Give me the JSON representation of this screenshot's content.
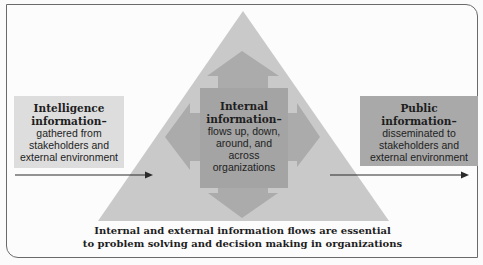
{
  "diagram": {
    "left_box": {
      "title_line1": "Intelligence",
      "title_line2": "information–",
      "body": [
        "gathered from",
        "stakeholders and",
        "external environment"
      ]
    },
    "center_box": {
      "title_line1": "Internal",
      "title_line2": "information–",
      "body": [
        "flows up, down,",
        "around, and",
        "across",
        "organizations"
      ]
    },
    "right_box": {
      "title_line1": "Public",
      "title_line2": "information–",
      "body": [
        "disseminated to",
        "stakeholders and",
        "external environment"
      ]
    },
    "caption": {
      "line1": "Internal and external information flows are essential",
      "line2": "to problem solving and decision making in organizations"
    },
    "colors": {
      "triangle": "#c9c9c9",
      "cross_arrows": "#ababab",
      "center_box": "#a4a4a4",
      "left_box": "#dddddd",
      "right_box": "#a9a9a9",
      "flow_arrow": "#2a2a2a"
    }
  }
}
